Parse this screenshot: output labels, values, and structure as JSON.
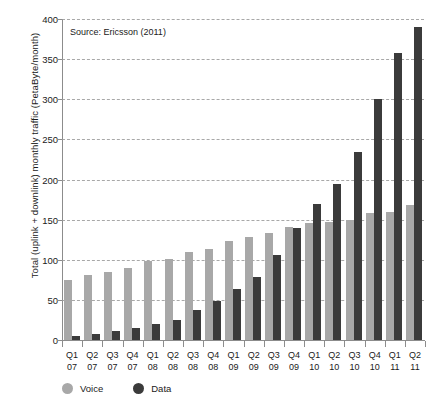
{
  "chart_data": {
    "type": "bar",
    "title": "",
    "annotation": "Source: Ericsson (2011)",
    "xlabel": "",
    "ylabel": "Total (uplink + downlink) monthly traffic (PetaByte/month)",
    "ylim": [
      0,
      400
    ],
    "yticks": [
      0,
      50,
      100,
      150,
      200,
      250,
      300,
      350,
      400
    ],
    "grid": true,
    "legend_position": "bottom-left",
    "categories": [
      "Q1 07",
      "Q2 07",
      "Q3 07",
      "Q4 07",
      "Q1 08",
      "Q2 08",
      "Q3 08",
      "Q4 08",
      "Q1 09",
      "Q2 09",
      "Q3 09",
      "Q4 09",
      "Q1 10",
      "Q2 10",
      "Q3 10",
      "Q4 10",
      "Q1 11",
      "Q2 11"
    ],
    "category_lines": [
      [
        "Q1",
        "07"
      ],
      [
        "Q2",
        "07"
      ],
      [
        "Q3",
        "07"
      ],
      [
        "Q4",
        "07"
      ],
      [
        "Q1",
        "08"
      ],
      [
        "Q2",
        "08"
      ],
      [
        "Q3",
        "08"
      ],
      [
        "Q4",
        "08"
      ],
      [
        "Q1",
        "09"
      ],
      [
        "Q2",
        "09"
      ],
      [
        "Q3",
        "09"
      ],
      [
        "Q4",
        "09"
      ],
      [
        "Q1",
        "10"
      ],
      [
        "Q2",
        "10"
      ],
      [
        "Q3",
        "10"
      ],
      [
        "Q4",
        "10"
      ],
      [
        "Q1",
        "11"
      ],
      [
        "Q2",
        "11"
      ]
    ],
    "series": [
      {
        "name": "Voice",
        "color": "#a8a8a8",
        "values": [
          75,
          81,
          85,
          90,
          98,
          101,
          110,
          114,
          124,
          128,
          133,
          141,
          146,
          147,
          150,
          158,
          160,
          168
        ]
      },
      {
        "name": "Data",
        "color": "#3b3b3b",
        "values": [
          5,
          8,
          11,
          15,
          20,
          25,
          38,
          49,
          64,
          79,
          106,
          140,
          170,
          195,
          234,
          300,
          358,
          390
        ]
      }
    ]
  },
  "legend": {
    "items": [
      {
        "label": "Voice",
        "color": "#a8a8a8"
      },
      {
        "label": "Data",
        "color": "#3b3b3b"
      }
    ]
  }
}
